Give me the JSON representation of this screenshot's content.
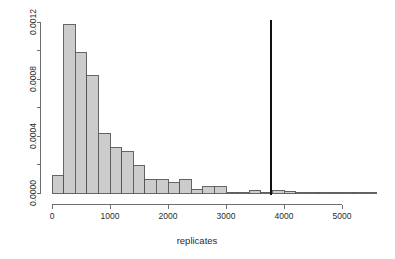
{
  "chart_data": {
    "type": "bar",
    "subtype": "histogram",
    "title": "",
    "xlabel": "replicates",
    "ylabel": "",
    "xlim": [
      0,
      5600
    ],
    "ylim": [
      0,
      0.00125
    ],
    "grid": false,
    "legend": null,
    "bin_width": 200,
    "x_ticks": [
      0,
      1000,
      2000,
      3000,
      4000,
      5000
    ],
    "x_tick_labels": [
      "0",
      "1000",
      "2000",
      "3000",
      "4000",
      "5000"
    ],
    "y_ticks": [
      0.0,
      0.0002,
      0.0004,
      0.0006,
      0.0008,
      0.001,
      0.0012
    ],
    "y_tick_labels": [
      "0.0000",
      "",
      "0.0004",
      "",
      "0.0008",
      "",
      "0.0012"
    ],
    "bins": [
      {
        "x0": 0,
        "x1": 200,
        "density": 0.000122
      },
      {
        "x0": 200,
        "x1": 400,
        "density": 0.001182
      },
      {
        "x0": 400,
        "x1": 600,
        "density": 0.000985
      },
      {
        "x0": 600,
        "x1": 800,
        "density": 0.000823
      },
      {
        "x0": 800,
        "x1": 1000,
        "density": 0.000421
      },
      {
        "x0": 1000,
        "x1": 1200,
        "density": 0.000317
      },
      {
        "x0": 1200,
        "x1": 1400,
        "density": 0.000289
      },
      {
        "x0": 1400,
        "x1": 1600,
        "density": 0.00019
      },
      {
        "x0": 1600,
        "x1": 1800,
        "density": 9.7e-05
      },
      {
        "x0": 1800,
        "x1": 2000,
        "density": 9.4e-05
      },
      {
        "x0": 2000,
        "x1": 2200,
        "density": 7.2e-05
      },
      {
        "x0": 2200,
        "x1": 2400,
        "density": 9.8e-05
      },
      {
        "x0": 2400,
        "x1": 2600,
        "density": 2.2e-05
      },
      {
        "x0": 2600,
        "x1": 2800,
        "density": 4.4e-05
      },
      {
        "x0": 2800,
        "x1": 3000,
        "density": 4.4e-05
      },
      {
        "x0": 3000,
        "x1": 3200,
        "density": 6e-06
      },
      {
        "x0": 3200,
        "x1": 3400,
        "density": 5e-06
      },
      {
        "x0": 3400,
        "x1": 3600,
        "density": 1.8e-05
      },
      {
        "x0": 3600,
        "x1": 3800,
        "density": 6e-06
      },
      {
        "x0": 3800,
        "x1": 4000,
        "density": 1.6e-05
      },
      {
        "x0": 4000,
        "x1": 4200,
        "density": 1.4e-05
      },
      {
        "x0": 4200,
        "x1": 4400,
        "density": 3e-06
      },
      {
        "x0": 4400,
        "x1": 4600,
        "density": 2e-06
      },
      {
        "x0": 4600,
        "x1": 4800,
        "density": 2e-06
      },
      {
        "x0": 4800,
        "x1": 5000,
        "density": 7e-06
      },
      {
        "x0": 5000,
        "x1": 5200,
        "density": 2e-06
      },
      {
        "x0": 5200,
        "x1": 5400,
        "density": 2e-06
      },
      {
        "x0": 5400,
        "x1": 5600,
        "density": 7e-06
      }
    ],
    "annotations": [
      {
        "name": "observed-value-line",
        "type": "vline",
        "x": 3780,
        "color": "#111111"
      }
    ]
  },
  "colors": {
    "bar_fill": "#cccccc",
    "bar_stroke": "#555555",
    "axis": "#6e6e6e",
    "text": "#2b2b2b",
    "vline": "#111111",
    "background": "#ffffff"
  }
}
